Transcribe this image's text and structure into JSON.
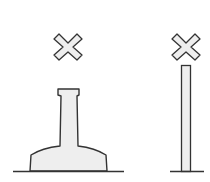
{
  "diagram": {
    "colors": {
      "stroke": "#333333",
      "fill": "#eeeeee",
      "background": "#ffffff"
    },
    "elements": [
      {
        "id": "left-cross",
        "shape": "x-mark"
      },
      {
        "id": "left-pedestal",
        "shape": "bottle-shaped pedestal"
      },
      {
        "id": "left-ground",
        "shape": "ground-line"
      },
      {
        "id": "right-cross",
        "shape": "x-mark"
      },
      {
        "id": "right-pole",
        "shape": "thin vertical pole"
      },
      {
        "id": "right-ground",
        "shape": "ground-line"
      }
    ]
  }
}
